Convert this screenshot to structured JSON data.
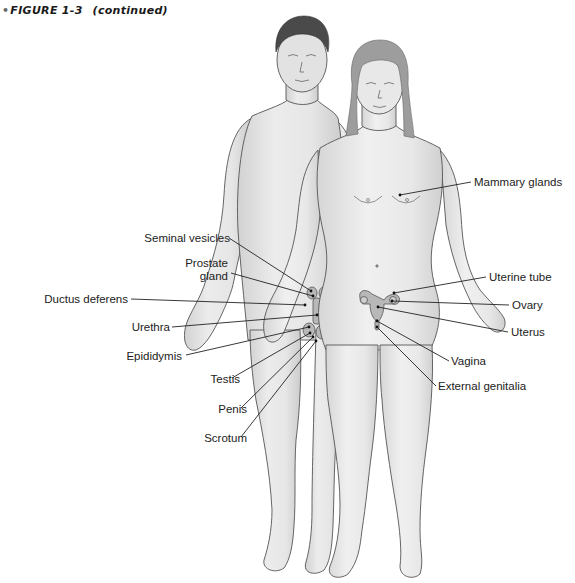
{
  "figure": {
    "caption_bullet": "•",
    "caption_title": "FIGURE 1-3",
    "caption_note": "(continued)",
    "colors": {
      "background": "#ffffff",
      "skin": "#e4e4e4",
      "skin_shade": "#cfcfcf",
      "outline": "#555555",
      "hair_male": "#4a4a4a",
      "hair_female": "#9a9a9a",
      "organ": "#b5b5b5",
      "leader_line": "#222222"
    }
  },
  "labels": {
    "male": [
      {
        "id": "seminal-vesicles",
        "text": "Seminal vesicles",
        "x": 122,
        "y": 232,
        "w": 108,
        "tx": 229,
        "ty": 238,
        "px": 311,
        "py": 291
      },
      {
        "id": "prostate-gland",
        "text": "Prostate\ngland",
        "x": 176,
        "y": 257,
        "w": 52,
        "tx": 231,
        "ty": 273,
        "px": 313,
        "py": 296
      },
      {
        "id": "ductus-deferens",
        "text": "Ductus deferens",
        "x": 24,
        "y": 293,
        "w": 104,
        "tx": 131,
        "ty": 299,
        "px": 305,
        "py": 305
      },
      {
        "id": "urethra",
        "text": "Urethra",
        "x": 122,
        "y": 321,
        "w": 48,
        "tx": 172,
        "ty": 327,
        "px": 317,
        "py": 315
      },
      {
        "id": "epididymis",
        "text": "Epididymis",
        "x": 110,
        "y": 350,
        "w": 72,
        "tx": 186,
        "ty": 355,
        "px": 309,
        "py": 327
      },
      {
        "id": "testis",
        "text": "Testis",
        "x": 200,
        "y": 373,
        "w": 40,
        "tx": 232,
        "ty": 378,
        "px": 310,
        "py": 333
      },
      {
        "id": "penis",
        "text": "Penis",
        "x": 211,
        "y": 403,
        "w": 36,
        "tx": 241,
        "ty": 408,
        "px": 313,
        "py": 337
      },
      {
        "id": "scrotum",
        "text": "Scrotum",
        "x": 195,
        "y": 432,
        "w": 52,
        "tx": 241,
        "ty": 437,
        "px": 316,
        "py": 341
      }
    ],
    "female": [
      {
        "id": "mammary-glands",
        "text": "Mammary glands",
        "x": 474,
        "y": 176,
        "w": 100,
        "tx": 471,
        "ty": 182,
        "px": 400,
        "py": 195
      },
      {
        "id": "uterine-tube",
        "text": "Uterine tube",
        "x": 489,
        "y": 271,
        "w": 80,
        "tx": 486,
        "ty": 277,
        "px": 394,
        "py": 293
      },
      {
        "id": "ovary",
        "text": "Ovary",
        "x": 512,
        "y": 299,
        "w": 40,
        "tx": 509,
        "ty": 305,
        "px": 392,
        "py": 301
      },
      {
        "id": "uterus",
        "text": "Uterus",
        "x": 511,
        "y": 326,
        "w": 44,
        "tx": 508,
        "ty": 332,
        "px": 378,
        "py": 307
      },
      {
        "id": "vagina",
        "text": "Vagina",
        "x": 451,
        "y": 355,
        "w": 44,
        "tx": 449,
        "ty": 361,
        "px": 377,
        "py": 321
      },
      {
        "id": "external-genitalia",
        "text": "External genitalia",
        "x": 438,
        "y": 380,
        "w": 110,
        "tx": 436,
        "ty": 386,
        "px": 377,
        "py": 327
      }
    ]
  }
}
